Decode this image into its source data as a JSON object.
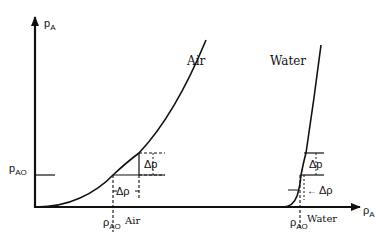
{
  "axes": {
    "y_label": "p",
    "y_label_sub": "A",
    "x_label": "ρ",
    "x_label_sub": "A",
    "y_ref_label": "p",
    "y_ref_label_sub": "AO"
  },
  "curves": {
    "air": {
      "label": "Air",
      "rho_label": "ρ",
      "rho_label_sub": "AO",
      "rho_caption": "Air",
      "delta_p": "Δp",
      "delta_rho": "Δρ"
    },
    "water": {
      "label": "Water",
      "rho_label": "ρ",
      "rho_label_sub": "AO",
      "rho_caption": "Water",
      "delta_p": "Δp",
      "delta_rho": "Δρ",
      "arrow": "←"
    }
  },
  "colors": {
    "line": "#111111",
    "background": "#ffffff"
  }
}
